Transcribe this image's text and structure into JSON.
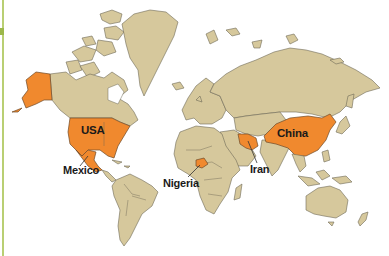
{
  "map": {
    "type": "world-political-highlight",
    "colors": {
      "land": "#d6c89c",
      "highlight": "#f0892e",
      "ocean": "#ffffff",
      "border": "#6f6a58",
      "frame_accent": "#b9cf73"
    },
    "highlighted_countries": [
      {
        "name": "USA",
        "label": "USA",
        "label_inside": true
      },
      {
        "name": "Mexico",
        "label": "Mexico",
        "label_inside": false
      },
      {
        "name": "Nigeria",
        "label": "Nigeria",
        "label_inside": false
      },
      {
        "name": "Iran",
        "label": "Iran",
        "label_inside": false
      },
      {
        "name": "China",
        "label": "China",
        "label_inside": true
      }
    ],
    "labels": {
      "usa": "USA",
      "mexico": "Mexico",
      "nigeria": "Nigeria",
      "iran": "Iran",
      "china": "China"
    }
  }
}
